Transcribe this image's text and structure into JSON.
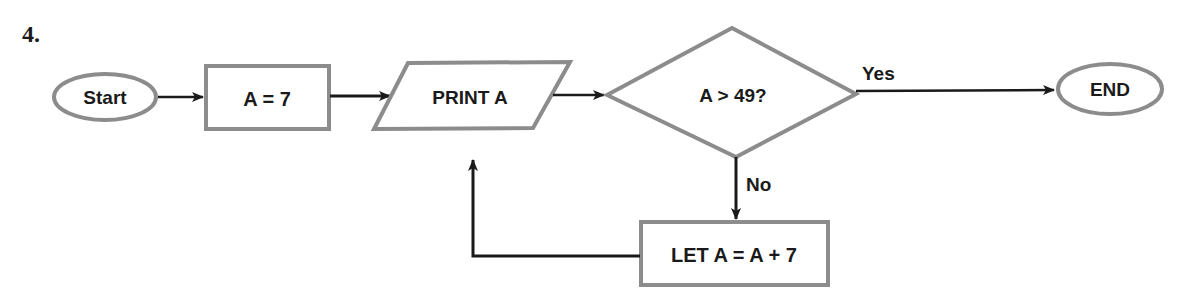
{
  "problem_number": "4.",
  "colors": {
    "shape_stroke": "#8c8c8c",
    "line": "#1a1a1a",
    "text": "#1a1a1a",
    "background": "#ffffff"
  },
  "nodes": {
    "start": {
      "shape": "terminator",
      "label": "Start"
    },
    "assign": {
      "shape": "process",
      "label": "A = 7"
    },
    "print": {
      "shape": "input-output",
      "label": "PRINT A"
    },
    "decision": {
      "shape": "decision",
      "label": "A > 49?"
    },
    "end": {
      "shape": "terminator",
      "label": "END"
    },
    "increment": {
      "shape": "process",
      "label": "LET A = A + 7"
    }
  },
  "edges": {
    "yes_label": "Yes",
    "no_label": "No",
    "list": [
      {
        "from": "start",
        "to": "assign"
      },
      {
        "from": "assign",
        "to": "print"
      },
      {
        "from": "print",
        "to": "decision"
      },
      {
        "from": "decision",
        "to": "end",
        "label": "Yes"
      },
      {
        "from": "decision",
        "to": "increment",
        "label": "No"
      },
      {
        "from": "increment",
        "to": "print"
      }
    ]
  }
}
